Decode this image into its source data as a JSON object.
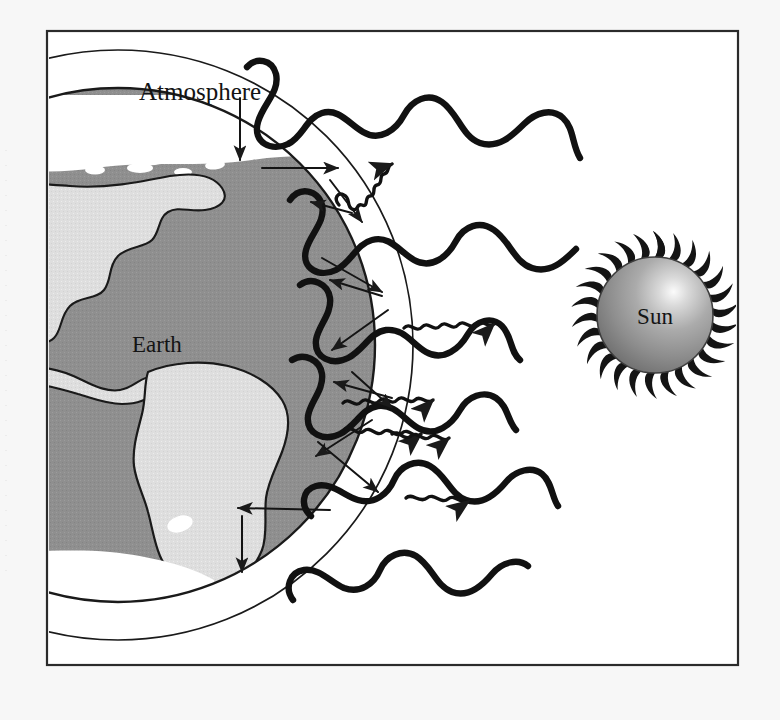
{
  "figure": {
    "kind": "greenhouse-effect-diagram",
    "title_visible": false,
    "labels": {
      "atmosphere": "Atmosphere",
      "earth": "Earth",
      "sun": "Sun"
    },
    "frame": {
      "border_color": "#2b2b2b",
      "fill": "#ffffff",
      "x": 47,
      "y": 31,
      "width": 691,
      "height": 634
    },
    "palette": {
      "ink": "#1a1a1a",
      "ocean": "#8f8f8f",
      "land": "#dedede",
      "ice": "#ffffff",
      "atmosphere_fill": "#ffffff",
      "sun_body_light": "#f2f2f2",
      "sun_body_mid": "#a5a5a5",
      "sun_body_dark": "#707070",
      "paper": "#f7f7f7"
    },
    "elements": {
      "earth_label_pos": [
        132,
        352
      ],
      "atmosphere_label_pos": [
        139,
        100
      ],
      "sun_label_pos": [
        655,
        320
      ],
      "earth_center": [
        118,
        345
      ],
      "earth_radius": 258,
      "atmosphere_inner_radius": 258,
      "atmosphere_outer_radius": 295,
      "sun_center": [
        655,
        315
      ],
      "sun_radius": 58,
      "sun_corona_spikes": 26
    },
    "annotations": {
      "incoming_wave_count": 6,
      "outgoing_squiggle_count": 5,
      "straight_arrow_count": 10,
      "wave_description": "thick wavy lines travelling from Sun toward Earth (shortwave solar radiation)",
      "squiggle_description": "thin tight squiggly arrows travelling away from Earth (outgoing longwave/infrared radiation)",
      "arrow_description": "straight arrows showing absorption, reflection and re-radiation inside the atmosphere"
    }
  }
}
